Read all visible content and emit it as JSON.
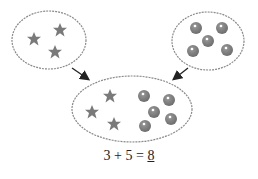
{
  "diagram": {
    "left_set": {
      "shape": "star",
      "count": 3
    },
    "right_set": {
      "shape": "ball",
      "count": 5
    },
    "combined_set": {
      "stars": 3,
      "balls": 5,
      "total": 8
    },
    "colors": {
      "item": "#7a7a7a",
      "outline": "#8a8a8a",
      "arrow": "#222222",
      "highlight": "#ffffff"
    }
  },
  "equation": {
    "a": "3",
    "plus": "+",
    "b": "5",
    "equals": "=",
    "answer": "8"
  }
}
